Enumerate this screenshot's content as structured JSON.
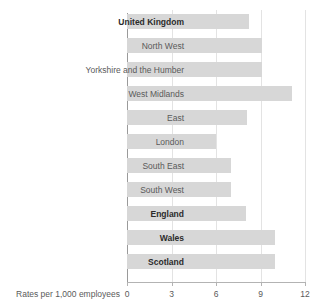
{
  "chart_data": {
    "type": "bar",
    "orientation": "horizontal",
    "title": "",
    "subtitle": "",
    "xlabel": "Rates per 1,000 employees",
    "ylabel": "",
    "xlim": [
      0,
      12
    ],
    "xticks": [
      0,
      3,
      6,
      9,
      12
    ],
    "xtick_labels": [
      "0",
      "3",
      "6",
      "9",
      "12"
    ],
    "grid": true,
    "legend": false,
    "bar_color": "#d7d7d7",
    "categories": [
      "United Kingdom",
      "North West",
      "Yorkshire and the Humber",
      "West Midlands",
      "East",
      "London",
      "South East",
      "South West",
      "England",
      "Wales",
      "Scotland"
    ],
    "values": [
      8.2,
      9.1,
      9.1,
      11.1,
      8.1,
      6.0,
      7.0,
      7.0,
      8.0,
      10.0,
      10.0
    ],
    "emphasis": [
      true,
      false,
      false,
      false,
      false,
      false,
      false,
      false,
      true,
      true,
      true
    ]
  }
}
